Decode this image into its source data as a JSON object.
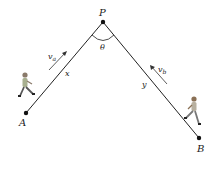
{
  "diagram": {
    "type": "geometry",
    "points": {
      "P": {
        "label": "P",
        "x": 103,
        "y": 22
      },
      "A": {
        "label": "A",
        "x": 26,
        "y": 113
      },
      "B": {
        "label": "B",
        "x": 199,
        "y": 138
      }
    },
    "segments": [
      {
        "from": "A",
        "to": "P",
        "label": "x"
      },
      {
        "from": "P",
        "to": "B",
        "label": "y"
      }
    ],
    "angle": {
      "vertex": "P",
      "label": "θ"
    },
    "velocities": [
      {
        "label": "v",
        "subscript": "a",
        "direction": "toward P"
      },
      {
        "label": "v",
        "subscript": "b",
        "direction": "toward P"
      }
    ],
    "walkers": [
      {
        "near": "A",
        "direction": "right"
      },
      {
        "near": "B",
        "direction": "left"
      }
    ]
  }
}
